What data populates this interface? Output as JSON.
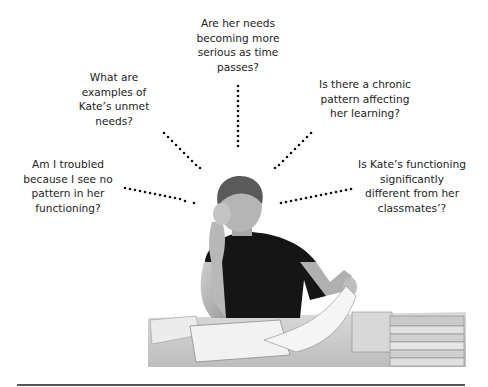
{
  "figure": {
    "questions": [
      {
        "id": "top",
        "lines": [
          "Are her needs",
          "becoming more",
          "serious as time",
          "passes?"
        ]
      },
      {
        "id": "upper-left",
        "lines": [
          "What are",
          "examples of",
          "Kate’s unmet",
          "needs?"
        ]
      },
      {
        "id": "upper-right",
        "lines": [
          "Is there a chronic",
          "pattern affecting",
          "her learning?"
        ]
      },
      {
        "id": "left",
        "lines": [
          "Am I troubled",
          "because I see no",
          "pattern in her",
          "functioning?"
        ]
      },
      {
        "id": "right",
        "lines": [
          "Is Kate’s functioning",
          "significantly",
          "different from her",
          "classmates’?"
        ]
      }
    ],
    "photo": {
      "subject": "teacher-at-desk-reviewing-papers"
    },
    "colors": {
      "text": "#222222",
      "dots": "#111111",
      "rule": "#555555",
      "shirt": "#151515"
    }
  }
}
